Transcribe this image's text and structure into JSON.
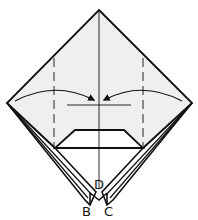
{
  "diagram": {
    "type": "origami-fold-step",
    "colors": {
      "paper_fill": "#efefef",
      "stroke": "#111111",
      "background": "#ffffff"
    },
    "labels": {
      "b": "B",
      "c": "C",
      "d": "D"
    },
    "elements": [
      "square-diamond-paper",
      "center-crease-line",
      "left-valley-fold-dashed",
      "right-valley-fold-dashed",
      "left-fold-arrow",
      "right-fold-arrow",
      "reference-horizontal-line",
      "trapezoid-flap",
      "left-bottom-flap",
      "right-bottom-flap"
    ]
  }
}
